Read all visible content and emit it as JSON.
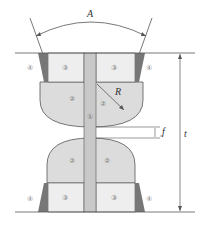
{
  "diagram": {
    "title": "",
    "labels": {
      "angle": "A",
      "radius": "R",
      "gap": "f",
      "thickness": "t"
    },
    "regions": {
      "strip": "①",
      "rounded": "②",
      "flat": "③",
      "corner": "④"
    },
    "colors": {
      "line": "#555555",
      "strip_fill": "#c8c8c8",
      "rounded_fill": "#dcdcdc",
      "flat_fill": "#eeeeee",
      "corner_fill": "#777777"
    }
  }
}
